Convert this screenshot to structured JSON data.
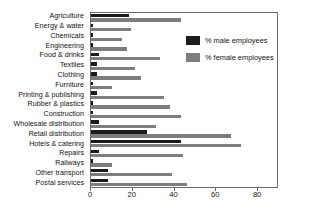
{
  "chart_data": {
    "type": "bar",
    "orientation": "horizontal",
    "title": "",
    "xlabel": "",
    "ylabel": "",
    "xlim": [
      0,
      90
    ],
    "xticks": [
      0,
      20,
      40,
      60,
      80
    ],
    "grid": false,
    "legend_position": "inside-right-top",
    "categories": [
      "Agriculture",
      "Energy & water",
      "Chemicals",
      "Engineering",
      "Food & drinks",
      "Textiles",
      "Clothing",
      "Furniture",
      "Printing & publishing",
      "Rubber & plastics",
      "Construction",
      "Wholesale distribution",
      "Retail distribution",
      "Hotels & catering",
      "Repairs",
      "Railways",
      "Other transport",
      "Postal services"
    ],
    "series": [
      {
        "name": "% male employees",
        "color": "#1c1c1c",
        "values": [
          18,
          1,
          1,
          1,
          4,
          3,
          3,
          1,
          3,
          1,
          1,
          4,
          27,
          43,
          4,
          1,
          8,
          8
        ]
      },
      {
        "name": "% female employees",
        "color": "#7d7d7d",
        "values": [
          43,
          19,
          15,
          17,
          33,
          21,
          24,
          10,
          35,
          38,
          43,
          31,
          67,
          72,
          44,
          10,
          39,
          46
        ]
      }
    ]
  },
  "legend": {
    "items": [
      {
        "label": "% male employees",
        "swatch": "male"
      },
      {
        "label": "% female employees",
        "swatch": "female"
      }
    ]
  },
  "axis": {
    "tick_labels": [
      "0",
      "20",
      "40",
      "60",
      "80"
    ]
  }
}
